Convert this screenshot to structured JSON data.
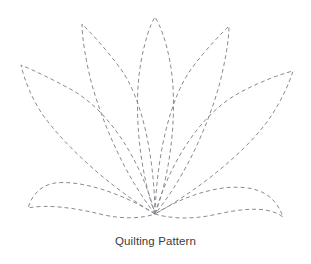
{
  "canvas": {
    "width": 311,
    "height": 264,
    "background": "#ffffff"
  },
  "caption": {
    "text": "Quilting Pattern",
    "color": "#3c3c3c"
  },
  "illustration": {
    "name": "lotus-flower-quilting-outline",
    "stroke_color": "#8a8a92",
    "stroke_width": 1,
    "dash_pattern": "4 3",
    "fill": "none",
    "base_point": {
      "x": 155,
      "y": 214
    },
    "petals": [
      {
        "name": "petal-center",
        "tip": {
          "x": 155,
          "y": 17
        },
        "path": "M155,214 C139,170 133,105 141,62 C145,40 150,25 155,17 C160,25 166,40 170,62 C178,105 172,170 155,214 Z"
      },
      {
        "name": "petal-inner-left",
        "tip": {
          "x": 82,
          "y": 24
        },
        "path": "M155,214 C126,177 104,127 92,85 C86,62 82,38 82,24 C92,34 106,49 120,68 C141,96 154,152 155,214 Z"
      },
      {
        "name": "petal-inner-right",
        "tip": {
          "x": 229,
          "y": 26
        },
        "path": "M155,214 C157,152 171,96 192,68 C206,49 220,35 229,26 C229,40 225,63 219,86 C207,128 185,177 155,214 Z"
      },
      {
        "name": "petal-outer-left",
        "tip": {
          "x": 21,
          "y": 65
        },
        "path": "M155,214 C113,189 70,151 45,118 C32,100 24,79 21,65 C33,70 52,79 72,90 C109,111 141,160 155,214 Z"
      },
      {
        "name": "petal-outer-right",
        "tip": {
          "x": 293,
          "y": 71
        },
        "path": "M155,214 C170,161 202,113 239,93 C259,82 281,74 293,71 C289,84 280,104 267,122 C242,155 198,190 155,214 Z"
      },
      {
        "name": "petal-bottom-left",
        "tip": {
          "x": 28,
          "y": 208
        },
        "path": "M155,214 C120,192 80,180 55,183 C43,185 33,192 28,208 C47,204 75,208 100,214 C124,220 143,218 155,214 Z"
      },
      {
        "name": "petal-bottom-right",
        "tip": {
          "x": 283,
          "y": 217
        },
        "path": "M155,214 C168,218 189,220 213,215 C240,209 267,205 283,217 C277,200 266,192 253,189 C228,183 190,192 155,214 Z"
      }
    ]
  }
}
